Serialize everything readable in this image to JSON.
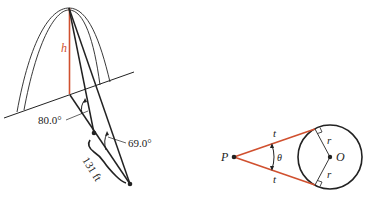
{
  "figure_left": {
    "height_label": "h",
    "angle_near_label": "80.0°",
    "angle_far_label": "69.0°",
    "distance_label": "131 ft"
  },
  "figure_right": {
    "point_label": "P",
    "center_label": "O",
    "tangent_label_top": "t",
    "tangent_label_bottom": "t",
    "radius_label_top": "r",
    "radius_label_bottom": "r",
    "angle_label": "θ"
  },
  "colors": {
    "accent": "#d0502f",
    "ink": "#222222"
  }
}
